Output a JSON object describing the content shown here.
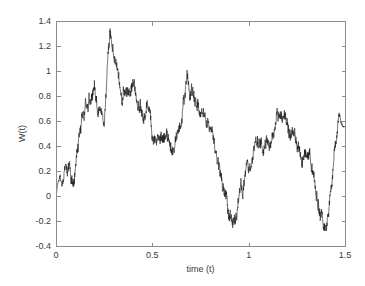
{
  "figure": {
    "background_color": "#ffffff",
    "axes_color": "#8c8c8c",
    "line_color": "#1a1a1a"
  },
  "chart_data": {
    "type": "line",
    "title": "",
    "subtitle": "",
    "xlabel": "time (t)",
    "ylabel": "W(t)",
    "xlim": [
      0,
      1.5
    ],
    "ylim": [
      -0.4,
      1.4
    ],
    "xticks": [
      0,
      0.5,
      1,
      1.5
    ],
    "xtick_labels": [
      "0",
      "0.5",
      "1",
      "1.5"
    ],
    "yticks": [
      -0.4,
      -0.2,
      0,
      0.2,
      0.4,
      0.6,
      0.8,
      1,
      1.2,
      1.4
    ],
    "ytick_labels": [
      "-0.4",
      "-0.2",
      "0",
      "0.2",
      "0.4",
      "0.6",
      "0.8",
      "1",
      "1.2",
      "1.4"
    ],
    "grid": false,
    "legend": null,
    "legend_position": "none",
    "series": [
      {
        "name": "W(t)",
        "color": "#1a1a1a",
        "description": "Simulated standard Brownian motion (Wiener process) sample path",
        "x": [
          0.0,
          0.01,
          0.02,
          0.03,
          0.04,
          0.05,
          0.06,
          0.07,
          0.08,
          0.09,
          0.1,
          0.12,
          0.14,
          0.16,
          0.18,
          0.2,
          0.22,
          0.24,
          0.25,
          0.26,
          0.27,
          0.28,
          0.3,
          0.32,
          0.34,
          0.36,
          0.38,
          0.4,
          0.42,
          0.44,
          0.46,
          0.48,
          0.5,
          0.52,
          0.54,
          0.55,
          0.57,
          0.59,
          0.61,
          0.63,
          0.65,
          0.67,
          0.68,
          0.7,
          0.72,
          0.74,
          0.76,
          0.78,
          0.8,
          0.82,
          0.84,
          0.86,
          0.88,
          0.9,
          0.92,
          0.94,
          0.96,
          0.98,
          1.0,
          1.02,
          1.04,
          1.06,
          1.08,
          1.1,
          1.12,
          1.14,
          1.16,
          1.18,
          1.2,
          1.22,
          1.24,
          1.26,
          1.28,
          1.3,
          1.32,
          1.34,
          1.36,
          1.38,
          1.4,
          1.42,
          1.44,
          1.46,
          1.47,
          1.48,
          1.5
        ],
        "y": [
          0.0,
          0.1,
          0.16,
          0.06,
          0.14,
          0.22,
          0.12,
          0.2,
          0.1,
          0.18,
          0.24,
          0.52,
          0.62,
          0.7,
          0.82,
          0.9,
          0.76,
          0.64,
          0.55,
          0.78,
          1.02,
          1.2,
          1.1,
          1.02,
          0.94,
          0.84,
          0.8,
          0.9,
          0.76,
          0.72,
          0.66,
          0.6,
          0.52,
          0.42,
          0.34,
          0.3,
          0.38,
          0.34,
          0.44,
          0.56,
          0.68,
          0.76,
          0.9,
          0.8,
          0.74,
          0.68,
          0.62,
          0.56,
          0.48,
          0.38,
          0.26,
          0.14,
          0.02,
          -0.16,
          -0.22,
          -0.1,
          0.02,
          0.14,
          0.24,
          0.34,
          0.44,
          0.5,
          0.44,
          0.48,
          0.52,
          0.58,
          0.6,
          0.56,
          0.5,
          0.46,
          0.5,
          0.44,
          0.34,
          0.26,
          0.18,
          0.12,
          0.02,
          -0.08,
          -0.22,
          -0.06,
          0.18,
          0.46,
          0.66,
          0.58,
          0.55
        ],
        "n_points": 85,
        "noise": {
          "enabled": true,
          "amplitude": 0.05,
          "octaves": 5,
          "seed": 20240617
        },
        "stats": {
          "start_value": 0.0,
          "end_value": 0.55,
          "maximum": 1.2,
          "maximum_at_t": 0.28,
          "minimum": -0.22,
          "minimum_at_t": 0.9
        }
      }
    ]
  },
  "geometry": {
    "plot_left": 56,
    "plot_top": 21,
    "plot_right": 345,
    "plot_bottom": 246,
    "tick_length": 4
  }
}
